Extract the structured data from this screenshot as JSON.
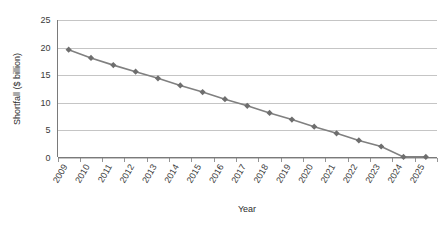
{
  "chart_data": {
    "type": "line",
    "title": "",
    "xlabel": "Year",
    "ylabel": "Shortfall ($ billion)",
    "ylim": [
      0,
      25
    ],
    "yticks": [
      0,
      5,
      10,
      15,
      20,
      25
    ],
    "ytick_labels": [
      "0",
      "5",
      "10",
      "15",
      "20",
      "25"
    ],
    "grid": true,
    "grid_axis": "y",
    "legend": false,
    "legend_position": "none",
    "marker": "diamond",
    "series_color": "#808080",
    "marker_color": "#6e6e6e",
    "gridline_color": "#b7b7b7",
    "axis_color": "#7a7a7a",
    "categories": [
      "2009",
      "2010",
      "2011",
      "2012",
      "2013",
      "2014",
      "2015",
      "2016",
      "2017",
      "2018",
      "2019",
      "2020",
      "2021",
      "2022",
      "2023",
      "2024",
      "2025"
    ],
    "x": [
      2009,
      2010,
      2011,
      2012,
      2013,
      2014,
      2015,
      2016,
      2017,
      2018,
      2019,
      2020,
      2021,
      2022,
      2023,
      2024,
      2025
    ],
    "values": [
      19.6,
      18.1,
      16.8,
      15.6,
      14.4,
      13.1,
      11.9,
      10.6,
      9.4,
      8.1,
      6.9,
      5.6,
      4.4,
      3.1,
      2.0,
      0.1,
      0.1
    ],
    "series": [
      {
        "name": "Shortfall",
        "values": [
          19.6,
          18.1,
          16.8,
          15.6,
          14.4,
          13.1,
          11.9,
          10.6,
          9.4,
          8.1,
          6.9,
          5.6,
          4.4,
          3.1,
          2.0,
          0.1,
          0.1
        ]
      }
    ],
    "annotations": []
  }
}
